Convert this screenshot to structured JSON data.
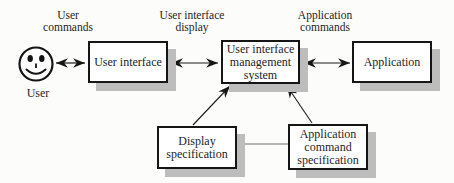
{
  "diagram_title": "User interface management system architecture",
  "colors": {
    "background": "#fcfcfa",
    "box_fill": "#ffffff",
    "box_border": "#161616",
    "box_shadow": "#bdbdbd",
    "text": "#1d1d1d",
    "arrow": "#1c1c1c",
    "spec_connector": "#9e9e9e"
  },
  "flow_labels": {
    "user_commands": {
      "lines": [
        "User",
        "commands"
      ]
    },
    "user_interface_display": {
      "lines": [
        "User interface",
        "display"
      ]
    },
    "application_commands": {
      "lines": [
        "Application",
        "commands"
      ]
    }
  },
  "nodes": {
    "user": {
      "label": "User"
    },
    "user_interface": {
      "lines": [
        "User interface"
      ]
    },
    "uims": {
      "lines": [
        "User interface",
        "management",
        "system"
      ]
    },
    "application": {
      "lines": [
        "Application"
      ]
    },
    "display_specification": {
      "lines": [
        "Display",
        "specification"
      ]
    },
    "application_command_specification": {
      "lines": [
        "Application",
        "command",
        "specification"
      ]
    }
  }
}
